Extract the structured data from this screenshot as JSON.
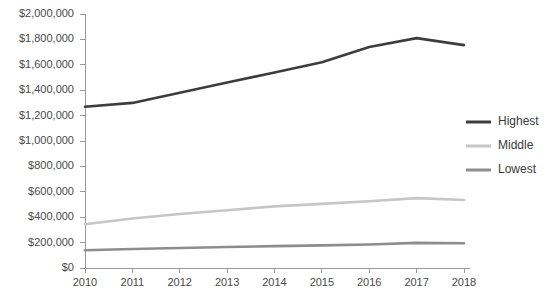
{
  "chart_data": {
    "type": "line",
    "title": "",
    "subtitle": "",
    "xlabel": "",
    "ylabel": "",
    "categories": [
      "2010",
      "2011",
      "2012",
      "2013",
      "2014",
      "2015",
      "2016",
      "2017",
      "2018"
    ],
    "x": [
      2010,
      2011,
      2012,
      2013,
      2014,
      2015,
      2016,
      2017,
      2018
    ],
    "ylim": [
      0,
      2000000
    ],
    "xlim": [
      2010,
      2018
    ],
    "grid": false,
    "legend_position": "right",
    "y_ticks": [
      0,
      200000,
      400000,
      600000,
      800000,
      1000000,
      1200000,
      1400000,
      1600000,
      1800000,
      2000000
    ],
    "y_tick_labels": [
      "$0",
      "$200,000",
      "$400,000",
      "$600,000",
      "$800,000",
      "$1,000,000",
      "$1,200,000",
      "$1,400,000",
      "$1,600,000",
      "$1,800,000",
      "$2,000,000"
    ],
    "series": [
      {
        "name": "Highest",
        "color": "#3d3d3d",
        "values": [
          1270000,
          1300000,
          1380000,
          1460000,
          1540000,
          1620000,
          1740000,
          1810000,
          1755000
        ]
      },
      {
        "name": "Middle",
        "color": "#c6c6c6",
        "values": [
          345000,
          390000,
          425000,
          455000,
          485000,
          505000,
          525000,
          550000,
          535000
        ]
      },
      {
        "name": "Lowest",
        "color": "#8d8d8d",
        "values": [
          140000,
          150000,
          158000,
          165000,
          172000,
          178000,
          185000,
          198000,
          195000
        ]
      }
    ]
  },
  "legend": {
    "items": [
      {
        "label": "Highest",
        "color": "#3d3d3d"
      },
      {
        "label": "Middle",
        "color": "#c6c6c6"
      },
      {
        "label": "Lowest",
        "color": "#8d8d8d"
      }
    ]
  },
  "axes": {
    "axis_color": "#9a9a9a"
  }
}
